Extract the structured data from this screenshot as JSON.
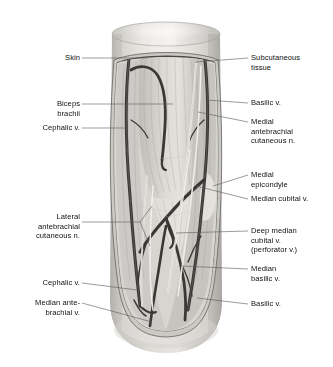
{
  "figure": {
    "orientation": "anterior view, right arm",
    "background_color": "#ffffff",
    "line_color": "#5a5a5a",
    "text_color": "#111111"
  },
  "labels": {
    "left": [
      {
        "id": "skin",
        "text": "Skin"
      },
      {
        "id": "biceps-brachii",
        "text": "Biceps\nbrachii"
      },
      {
        "id": "cephalic-vein-upper",
        "text": "Cephalic v."
      },
      {
        "id": "lateral-antebrachial-cutaneous-nerve",
        "text": "Lateral\nantebrachial\ncutaneous n."
      },
      {
        "id": "cephalic-vein-lower",
        "text": "Cephalic v."
      },
      {
        "id": "median-antebrachial-vein",
        "text": "Median ante-\nbrachial v."
      }
    ],
    "right": [
      {
        "id": "subcutaneous-tissue",
        "text": "Subcutaneous\ntissue"
      },
      {
        "id": "basilic-vein-upper",
        "text": "Basilic v."
      },
      {
        "id": "medial-antebrachial-cutaneous-nerve",
        "text": "Medial\nantebrachial\ncutaneous n."
      },
      {
        "id": "medial-epicondyle",
        "text": "Medial\nepicondyle"
      },
      {
        "id": "median-cubital-vein",
        "text": "Median cubital v."
      },
      {
        "id": "deep-median-cubital-vein",
        "text": "Deep median\ncubital v.\n(perforator v.)"
      },
      {
        "id": "median-basilic-vein",
        "text": "Median\nbasilic v."
      },
      {
        "id": "basilic-vein-lower",
        "text": "Basilic v."
      }
    ]
  }
}
